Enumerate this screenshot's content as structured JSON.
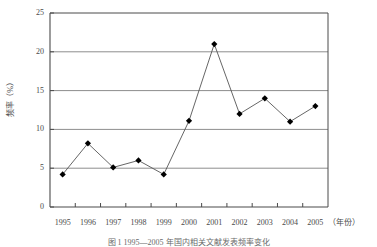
{
  "chart_data": {
    "type": "line",
    "title": "",
    "subtitle": "",
    "xlabel": "年份",
    "xlabel_display": "（年份）",
    "ylabel": "频率（%）",
    "categories": [
      "1995",
      "1996",
      "1997",
      "1998",
      "1999",
      "2000",
      "2001",
      "2002",
      "2003",
      "2004",
      "2005"
    ],
    "values": [
      4.2,
      8.2,
      5.1,
      6.0,
      4.2,
      11.1,
      21.0,
      12.0,
      14.0,
      11.0,
      13.0
    ],
    "series": [
      {
        "name": "频率",
        "values": [
          4.2,
          8.2,
          5.1,
          6.0,
          4.2,
          11.1,
          21.0,
          12.0,
          14.0,
          11.0,
          13.0
        ]
      }
    ],
    "ylim": [
      0,
      25
    ],
    "yticks": [
      0,
      5,
      10,
      15,
      20,
      25
    ],
    "ytick_labels": [
      "0",
      "5",
      "10",
      "15",
      "20",
      "25"
    ],
    "grid": true,
    "grid_axis": "y",
    "legend": false,
    "legend_position": "none",
    "marker": "diamond",
    "marker_color": "#000000",
    "line_color": "#555555",
    "grid_color": "#8d8d8d",
    "axis_color": "#4a4a4a",
    "background_color": "#ffffff"
  },
  "caption": {
    "text": "图 1  1995—2005 年国内相关文献发表频率变化"
  }
}
